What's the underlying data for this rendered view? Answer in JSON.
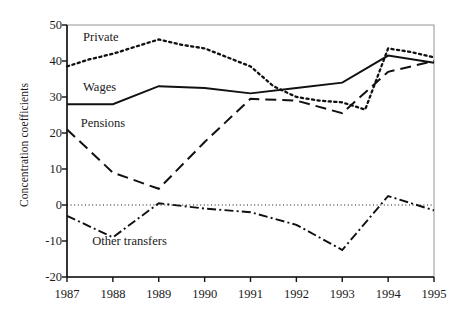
{
  "chart_data": {
    "type": "line",
    "title": "",
    "xlabel": "",
    "ylabel": "Concentration coefficients",
    "x": [
      1987,
      1988,
      1989,
      1990,
      1991,
      1992,
      1993,
      1994,
      1995
    ],
    "xtick_labels": [
      "1987",
      "1988",
      "1989",
      "1990",
      "1991",
      "1992",
      "1993",
      "1994",
      "1995"
    ],
    "xlim": [
      1987,
      1995
    ],
    "ylim": [
      -20,
      50
    ],
    "ytick_labels": [
      "50",
      "40",
      "30",
      "20",
      "10",
      "0",
      "-10",
      "-20"
    ],
    "yticks": [
      50,
      40,
      30,
      20,
      10,
      0,
      -10,
      -20
    ],
    "grid": false,
    "zero_line": true,
    "legend_position": "inline-annotations",
    "series": [
      {
        "name": "Private",
        "label": "Private",
        "style": "dotted",
        "color": "#111111",
        "x": [
          1987,
          1987.5,
          1988,
          1988.5,
          1989,
          1989.5,
          1990,
          1990.5,
          1991,
          1991.5,
          1992,
          1992.5,
          1993,
          1993.5,
          1994,
          1994.5,
          1995
        ],
        "values": [
          38.5,
          40.5,
          42,
          44,
          46,
          44.5,
          43.5,
          41,
          38.5,
          33,
          30,
          29,
          28.5,
          26.5,
          43.5,
          42.5,
          41
        ]
      },
      {
        "name": "Wages",
        "label": "Wages",
        "style": "solid",
        "color": "#111111",
        "x": [
          1987,
          1988,
          1989,
          1990,
          1991,
          1992,
          1993,
          1994,
          1995
        ],
        "values": [
          28,
          28,
          33,
          32.5,
          31,
          32.5,
          34,
          41.5,
          39.5
        ]
      },
      {
        "name": "Pensions",
        "label": "Pensions",
        "style": "dashed",
        "color": "#111111",
        "x": [
          1987,
          1988,
          1989,
          1990,
          1991,
          1992,
          1993,
          1994,
          1995
        ],
        "values": [
          21,
          9,
          4.5,
          17.5,
          29.5,
          29,
          25.5,
          37,
          40
        ]
      },
      {
        "name": "Other transfers",
        "label": "Other transfers",
        "style": "dash-dot",
        "color": "#111111",
        "x": [
          1987,
          1988,
          1989,
          1990,
          1991,
          1992,
          1993,
          1994,
          1995
        ],
        "values": [
          -3,
          -9,
          0.5,
          -1,
          -2,
          -5.5,
          -12.5,
          2.5,
          -1.5
        ]
      }
    ],
    "annotations": [
      {
        "text": "Private",
        "x": 1987.35,
        "y": 46.5
      },
      {
        "text": "Wages",
        "x": 1987.35,
        "y": 32.5
      },
      {
        "text": "Pensions",
        "x": 1987.3,
        "y": 22.5
      },
      {
        "text": "Other transfers",
        "x": 1987.55,
        "y": -10.2
      }
    ]
  }
}
